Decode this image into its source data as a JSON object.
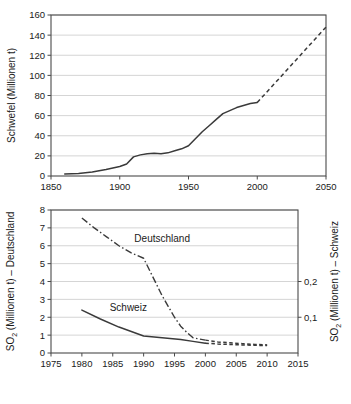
{
  "chart_data": [
    {
      "type": "line",
      "id": "schwefel",
      "title": "",
      "xlabel": "",
      "ylabel": "Schwefel (Millionen t)",
      "xlim": [
        1850,
        2050
      ],
      "ylim": [
        0,
        160
      ],
      "xticks": [
        1850,
        1900,
        1950,
        2000,
        2050
      ],
      "xtick_labels": [
        "1850",
        "1900",
        "1950",
        "2000",
        "2050"
      ],
      "yticks": [
        0,
        20,
        40,
        60,
        80,
        100,
        120,
        140,
        160
      ],
      "ytick_labels": [
        "0",
        "20",
        "40",
        "60",
        "80",
        "100",
        "120",
        "140",
        "160"
      ],
      "grid": true,
      "legend": "none",
      "series": [
        {
          "name": "Schwefelproduktion",
          "style": "solid",
          "x": [
            1860,
            1870,
            1880,
            1890,
            1900,
            1905,
            1910,
            1915,
            1920,
            1925,
            1930,
            1935,
            1940,
            1945,
            1950,
            1955,
            1960,
            1965,
            1970,
            1975,
            1980,
            1985,
            1990,
            1995,
            2000
          ],
          "values": [
            2,
            2.5,
            4,
            6.5,
            9.5,
            12,
            19,
            21,
            22,
            22.5,
            22,
            23,
            25,
            27,
            30,
            37,
            44,
            50,
            56,
            62,
            65,
            68,
            70,
            72,
            73
          ]
        },
        {
          "name": "Schwefelproduktion (Prognose)",
          "style": "dashed",
          "x": [
            2000,
            2010,
            2020,
            2030,
            2040,
            2050
          ],
          "values": [
            73,
            88,
            103,
            118,
            133,
            148
          ]
        }
      ]
    },
    {
      "type": "line",
      "id": "so2",
      "title": "",
      "xlabel": "",
      "ylabel": "SO2 (Millionen t) – Deutschland",
      "ylabel_main": "SO",
      "ylabel_sub": "2",
      "ylabel_rest": " (Millionen t) – Deutschland",
      "ylabel_right": "SO2 (Millionen t) – Schweiz",
      "ylabel_right_rest": " (Millionen t) – Schweiz",
      "xlim": [
        1975,
        2015
      ],
      "ylim": [
        0,
        8
      ],
      "ylim_right": [
        0,
        0.4
      ],
      "xticks": [
        1975,
        1980,
        1985,
        1990,
        1995,
        2000,
        2005,
        2010,
        2015
      ],
      "xtick_labels": [
        "1975",
        "1980",
        "1985",
        "1990",
        "1995",
        "2000",
        "2005",
        "2010",
        "2015"
      ],
      "yticks": [
        0,
        1,
        2,
        3,
        4,
        5,
        6,
        7,
        8
      ],
      "ytick_labels": [
        "0",
        "1",
        "2",
        "3",
        "4",
        "5",
        "6",
        "7",
        "8"
      ],
      "yticks_right": [
        2,
        4
      ],
      "ytick_labels_right": [
        "0,1",
        "0,2"
      ],
      "grid": true,
      "legend": "inline",
      "series": [
        {
          "name": "Deutschland",
          "style": "dashdot",
          "axis": "left",
          "x": [
            1980,
            1982,
            1984,
            1986,
            1988,
            1990,
            1991,
            1992,
            1993,
            1994,
            1995,
            1996,
            1997,
            1998,
            2000
          ],
          "values": [
            7.55,
            7.0,
            6.5,
            6.0,
            5.6,
            5.3,
            4.6,
            3.9,
            3.2,
            2.6,
            2.0,
            1.5,
            1.15,
            0.85,
            0.72
          ]
        },
        {
          "name": "Deutschland (Prognose)",
          "style": "dashed",
          "axis": "left",
          "x": [
            2000,
            2002,
            2004,
            2006,
            2008,
            2010
          ],
          "values": [
            0.72,
            0.62,
            0.57,
            0.52,
            0.48,
            0.45
          ]
        },
        {
          "name": "Schweiz",
          "style": "solid",
          "axis": "right",
          "x": [
            1980,
            1983,
            1986,
            1990,
            1993,
            1996,
            1998,
            2000
          ],
          "values": [
            2.4,
            1.9,
            1.45,
            0.95,
            0.85,
            0.75,
            0.65,
            0.55
          ]
        },
        {
          "name": "Schweiz (Prognose)",
          "style": "dashed",
          "axis": "right",
          "x": [
            2000,
            2002,
            2004,
            2006,
            2008,
            2010
          ],
          "values": [
            0.55,
            0.5,
            0.48,
            0.45,
            0.43,
            0.42
          ]
        }
      ],
      "annotations": [
        {
          "text": "Deutschland",
          "x": 1988.5,
          "y": 6.2
        },
        {
          "text": "Schweiz",
          "x": 1984.5,
          "y": 2.35
        }
      ]
    }
  ]
}
